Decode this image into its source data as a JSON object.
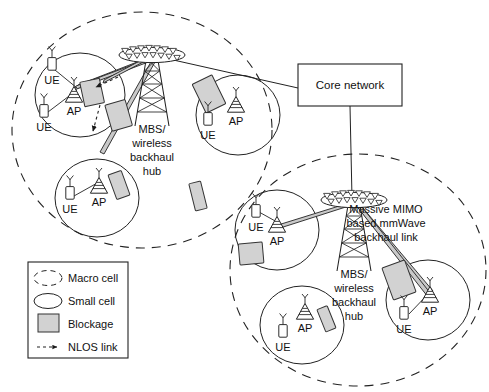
{
  "figure": {
    "background": "#ffffff",
    "stroke": "#222222",
    "blockage_fill": "#d2d2d2",
    "link_fill": "#c9c9c9"
  },
  "core": {
    "label": "Core network",
    "box": {
      "x": 298,
      "y": 64,
      "w": 104,
      "h": 42
    }
  },
  "macro_cells": [
    {
      "id": "macro-top-left",
      "label": "Macro cell",
      "cx": 142,
      "cy": 130,
      "rx": 130,
      "ry": 118
    },
    {
      "id": "macro-bottom-right",
      "label": "Macro cell",
      "cx": 358,
      "cy": 270,
      "rx": 128,
      "ry": 116
    }
  ],
  "mbs_nodes": [
    {
      "id": "mbs-top",
      "label_lines": [
        "MBS/",
        "wireless",
        "backhaul",
        "hub"
      ],
      "x": 152,
      "y": 52
    },
    {
      "id": "mbs-bottom",
      "label_lines": [
        "MBS/",
        "wireless",
        "backhaul",
        "hub"
      ],
      "x": 354,
      "y": 197
    }
  ],
  "annotation": {
    "id": "backhaul-link-annotation",
    "lines": [
      "Massive MIMO",
      "based mmWave",
      "backhaul link"
    ],
    "x": 386,
    "y": 213
  },
  "small_cells": [
    {
      "id": "small-cell-1",
      "cx": 80,
      "cy": 95,
      "rx": 45,
      "ry": 42,
      "ue": [
        {
          "label": "UE",
          "x": 52,
          "y": 63
        },
        {
          "label": "UE",
          "x": 44,
          "y": 110
        }
      ],
      "ap": {
        "label": "AP",
        "x": 74,
        "y": 95
      }
    },
    {
      "id": "small-cell-2",
      "cx": 97,
      "cy": 198,
      "rx": 42,
      "ry": 39,
      "ue": [
        {
          "label": "UE",
          "x": 70,
          "y": 192
        }
      ],
      "ap": {
        "label": "AP",
        "x": 99,
        "y": 186
      }
    },
    {
      "id": "small-cell-3",
      "cx": 238,
      "cy": 115,
      "rx": 42,
      "ry": 40,
      "ue": [
        {
          "label": "UE",
          "x": 208,
          "y": 118
        }
      ],
      "ap": {
        "label": "AP",
        "x": 236,
        "y": 105
      }
    },
    {
      "id": "small-cell-4",
      "cx": 277,
      "cy": 230,
      "rx": 42,
      "ry": 40,
      "ue": [
        {
          "label": "UE",
          "x": 256,
          "y": 210
        }
      ],
      "ap": {
        "label": "AP",
        "x": 277,
        "y": 225
      }
    },
    {
      "id": "small-cell-5",
      "cx": 302,
      "cy": 325,
      "rx": 42,
      "ry": 39,
      "ue": [
        {
          "label": "UE",
          "x": 283,
          "y": 330
        }
      ],
      "ap": {
        "label": "AP",
        "x": 305,
        "y": 312
      }
    },
    {
      "id": "small-cell-6",
      "cx": 428,
      "cy": 300,
      "rx": 42,
      "ry": 40,
      "ue": [
        {
          "label": "UE",
          "x": 404,
          "y": 312
        }
      ],
      "ap": {
        "label": "AP",
        "x": 430,
        "y": 295
      }
    }
  ],
  "legend": {
    "box": {
      "x": 28,
      "y": 262,
      "w": 100,
      "h": 96
    },
    "items": [
      {
        "id": "legend-macro-cell",
        "icon": "dashed-ellipse",
        "label": "Macro cell"
      },
      {
        "id": "legend-small-cell",
        "icon": "solid-ellipse",
        "label": "Small cell"
      },
      {
        "id": "legend-blockage",
        "icon": "gray-rectangle",
        "label": "Blockage"
      },
      {
        "id": "legend-nlos-link",
        "icon": "dashed-arrow",
        "label": "NLOS link"
      }
    ]
  },
  "node_labels": {
    "ue": "UE",
    "ap": "AP"
  },
  "counts": {
    "macro_cells": 2,
    "small_cells": 6,
    "mbs": 2,
    "ue": 8,
    "ap": 6,
    "blockages": 9
  }
}
